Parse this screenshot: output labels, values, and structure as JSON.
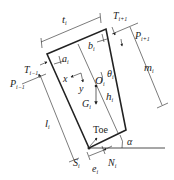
{
  "diagram": {
    "labels": {
      "t": "t",
      "t_sub": "i",
      "T_top": "T",
      "T_top_sub": "i+1",
      "P_top": "P",
      "P_top_sub": "i+1",
      "b": "b",
      "b_sub": "i",
      "a": "a",
      "a_sub": "i",
      "T_left": "T",
      "T_left_sub": "i−1",
      "P_left": "P",
      "P_left_sub": "i−1",
      "theta": "θ",
      "theta_sub": "i",
      "m": "m",
      "m_sub": "i",
      "x": "x",
      "y": "y",
      "O": "O",
      "O_sub": "i",
      "G": "G",
      "G_sub": "i",
      "h": "h",
      "h_sub": "i",
      "l": "l",
      "l_sub": "i",
      "toe": "Toe",
      "alpha": "α",
      "S": "S",
      "S_sub": "i",
      "e": "e",
      "e_sub": "i",
      "N": "N",
      "N_sub": "i"
    },
    "colors": {
      "stroke": "#222222",
      "background": "#ffffff"
    }
  }
}
